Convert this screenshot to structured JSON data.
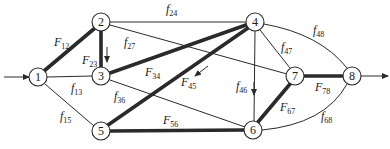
{
  "diagram": {
    "type": "flow-network",
    "nodes": [
      {
        "id": "1",
        "label": "1",
        "x": 38,
        "y": 77
      },
      {
        "id": "2",
        "label": "2",
        "x": 101,
        "y": 22
      },
      {
        "id": "3",
        "label": "3",
        "x": 101,
        "y": 76
      },
      {
        "id": "4",
        "label": "4",
        "x": 255,
        "y": 22
      },
      {
        "id": "5",
        "label": "5",
        "x": 101,
        "y": 131
      },
      {
        "id": "6",
        "label": "6",
        "x": 253,
        "y": 130
      },
      {
        "id": "7",
        "label": "7",
        "x": 295,
        "y": 76
      },
      {
        "id": "8",
        "label": "8",
        "x": 352,
        "y": 76
      }
    ],
    "edges": [
      {
        "from": "1",
        "to": "2",
        "label_main": "F",
        "label_sub": "12",
        "weight": "thick"
      },
      {
        "from": "2",
        "to": "3",
        "label_main": "F",
        "label_sub": "23",
        "weight": "thick",
        "direction_arrow": "down"
      },
      {
        "from": "2",
        "to": "4",
        "label_main": "f",
        "label_sub": "24",
        "weight": "thin"
      },
      {
        "from": "2",
        "to": "7",
        "label_main": "f",
        "label_sub": "27",
        "weight": "thin"
      },
      {
        "from": "1",
        "to": "3",
        "label_main": "f",
        "label_sub": "13",
        "weight": "thin"
      },
      {
        "from": "1",
        "to": "5",
        "label_main": "f",
        "label_sub": "15",
        "weight": "thin"
      },
      {
        "from": "3",
        "to": "4",
        "label_main": "F",
        "label_sub": "34",
        "weight": "thick"
      },
      {
        "from": "3",
        "to": "6",
        "label_main": "f",
        "label_sub": "36",
        "weight": "thin"
      },
      {
        "from": "4",
        "to": "5",
        "label_main": "F",
        "label_sub": "45",
        "weight": "thick",
        "direction_arrow": "down-left"
      },
      {
        "from": "4",
        "to": "6",
        "label_main": "f",
        "label_sub": "46",
        "weight": "thin",
        "direction_arrow": "down"
      },
      {
        "from": "4",
        "to": "7",
        "label_main": "f",
        "label_sub": "47",
        "weight": "thin"
      },
      {
        "from": "4",
        "to": "8",
        "label_main": "f",
        "label_sub": "48",
        "weight": "thin",
        "curved": true
      },
      {
        "from": "5",
        "to": "6",
        "label_main": "F",
        "label_sub": "56",
        "weight": "thick"
      },
      {
        "from": "6",
        "to": "7",
        "label_main": "F",
        "label_sub": "67",
        "weight": "thick"
      },
      {
        "from": "6",
        "to": "8",
        "label_main": "f",
        "label_sub": "68",
        "weight": "thin",
        "curved": true
      },
      {
        "from": "7",
        "to": "8",
        "label_main": "F",
        "label_sub": "78",
        "weight": "thick"
      }
    ],
    "source_arrow": {
      "into": "1"
    },
    "sink_arrow": {
      "out_of": "8"
    },
    "colors": {
      "stroke": "#2a2a2a",
      "background": "#ffffff"
    }
  }
}
